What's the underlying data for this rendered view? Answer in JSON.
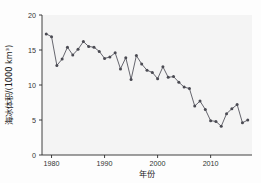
{
  "chart_data": {
    "type": "line",
    "title": "",
    "subtitle": "",
    "xlabel": "年份",
    "ylabel": "海冰体积/(1000 km³)",
    "xlim": [
      1978.2,
      2017.8
    ],
    "ylim": [
      0,
      20
    ],
    "xticks": [
      1980,
      1990,
      2000,
      2010
    ],
    "xtick_labels": [
      "1980",
      "1990",
      "2000",
      "2010"
    ],
    "yticks": [
      0,
      5,
      10,
      15,
      20
    ],
    "ytick_labels": [
      "0",
      "5",
      "10",
      "15",
      "20"
    ],
    "grid": false,
    "legend": null,
    "marker": "circle",
    "line_color": "#5e5e66",
    "marker_color": "#4a4a52",
    "plot_background": "#f4f4f4",
    "x": [
      1979,
      1980,
      1981,
      1982,
      1983,
      1984,
      1985,
      1986,
      1987,
      1988,
      1989,
      1990,
      1991,
      1992,
      1993,
      1994,
      1995,
      1996,
      1997,
      1998,
      1999,
      2000,
      2001,
      2002,
      2003,
      2004,
      2005,
      2006,
      2007,
      2008,
      2009,
      2010,
      2011,
      2012,
      2013,
      2014,
      2015,
      2016,
      2017
    ],
    "values": [
      17.3,
      16.9,
      12.8,
      13.7,
      15.4,
      14.3,
      15.1,
      16.2,
      15.5,
      15.4,
      14.8,
      13.8,
      14.0,
      14.6,
      12.3,
      13.9,
      10.8,
      14.2,
      13.0,
      12.1,
      11.8,
      10.9,
      12.6,
      11.1,
      11.2,
      10.4,
      9.7,
      9.5,
      7.0,
      7.7,
      6.5,
      4.9,
      4.8,
      4.1,
      5.9,
      6.6,
      7.2,
      4.6,
      5.0
    ],
    "annotations": []
  },
  "axis": {
    "xlabel": "年份",
    "ylabel": "海冰体积/(1000 km³)"
  }
}
